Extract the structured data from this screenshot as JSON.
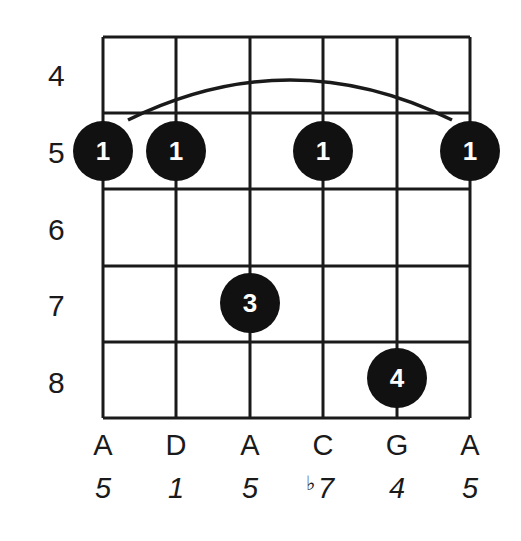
{
  "diagram": {
    "type": "guitar-chord-chart",
    "colors": {
      "ink": "#111111",
      "background": "#ffffff",
      "finger_text": "#ffffff"
    },
    "fret_labels": [
      "4",
      "5",
      "6",
      "7",
      "8"
    ],
    "strings": [
      {
        "note": "A",
        "interval": "5",
        "flat": ""
      },
      {
        "note": "D",
        "interval": "1",
        "flat": ""
      },
      {
        "note": "A",
        "interval": "5",
        "flat": ""
      },
      {
        "note": "C",
        "interval": "7",
        "flat": "♭"
      },
      {
        "note": "G",
        "interval": "4",
        "flat": ""
      },
      {
        "note": "A",
        "interval": "5",
        "flat": ""
      }
    ],
    "fingers": [
      {
        "string": 1,
        "fret": 5,
        "finger": "1"
      },
      {
        "string": 2,
        "fret": 5,
        "finger": "1"
      },
      {
        "string": 4,
        "fret": 5,
        "finger": "1"
      },
      {
        "string": 6,
        "fret": 5,
        "finger": "1"
      },
      {
        "string": 3,
        "fret": 7,
        "finger": "3"
      },
      {
        "string": 5,
        "fret": 8,
        "finger": "4"
      }
    ],
    "barre": {
      "fret": 5,
      "from_string": 1,
      "to_string": 6
    }
  }
}
